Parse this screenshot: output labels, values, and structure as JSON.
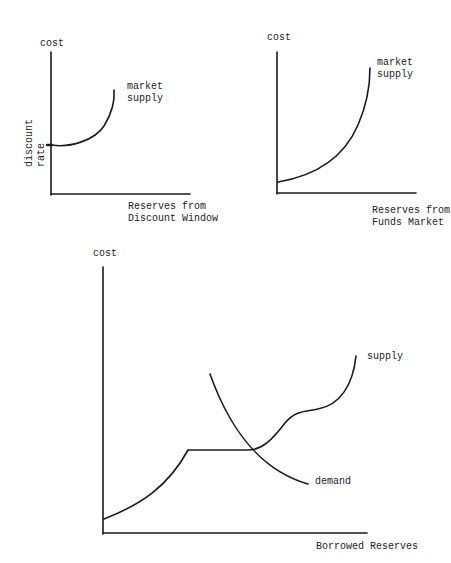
{
  "colors": {
    "ink": "#1a1a1a",
    "background": "#ffffff"
  },
  "panels": {
    "discount_window": {
      "y_label": "cost",
      "y_sublabel": "discount rate",
      "curve_label_line1": "market",
      "curve_label_line2": "supply",
      "x_label_line1": "Reserves from",
      "x_label_line2": "Discount Window"
    },
    "funds_market": {
      "y_label": "cost",
      "curve_label_line1": "market",
      "curve_label_line2": "supply",
      "x_label_line1": "Reserves from",
      "x_label_line2": "Funds Market"
    },
    "borrowed_reserves": {
      "y_label": "cost",
      "supply_label": "supply",
      "demand_label": "demand",
      "x_label": "Borrowed Reserves"
    }
  }
}
